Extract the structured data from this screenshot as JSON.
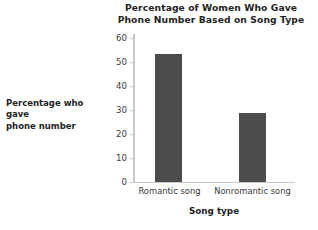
{
  "chart_data": {
    "type": "bar",
    "title": "Percentage of Women Who Gave Phone Number Based on Song Type",
    "title_lines": [
      "Percentage of Women Who Gave",
      "Phone Number Based on Song Type"
    ],
    "categories": [
      "Romantic song",
      "Nonromantic song"
    ],
    "values": [
      52,
      28
    ],
    "xlabel": "Song type",
    "ylabel": "Percentage who gave phone number",
    "ylabel_lines": [
      "Percentage who gave",
      "phone number"
    ],
    "ylim": [
      0,
      60
    ],
    "ytick_labels": [
      "0",
      "10",
      "20",
      "30",
      "40",
      "50",
      "60"
    ],
    "ytick_values": [
      0,
      10,
      20,
      30,
      40,
      50,
      60
    ],
    "grid": false,
    "legend": false,
    "bar_color": "#4c4c4c",
    "axis_color": "#c9c9c9",
    "background_color": "#ffffff",
    "text_color": "#1f1f1f"
  }
}
